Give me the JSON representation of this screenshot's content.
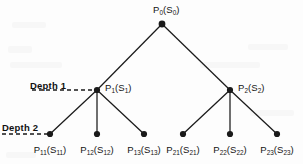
{
  "figure": {
    "type": "tree-diagram",
    "background_color": "#fdfdfd",
    "stroke_color": "#1a1a1a",
    "width": 303,
    "height": 164
  },
  "depth_markers": [
    {
      "id": "depth-1",
      "label": "Depth 1",
      "text_x": 30,
      "text_y": 80,
      "line_x1": 32,
      "line_x2": 95,
      "line_y": 90
    },
    {
      "id": "depth-2",
      "label": "Depth 2",
      "text_x": 2,
      "text_y": 122,
      "line_x1": 2,
      "line_x2": 48,
      "line_y": 134
    }
  ],
  "nodes": [
    {
      "id": "root",
      "name": "P",
      "sub": "0",
      "state_name": "S",
      "state_sub": "0",
      "x": 162,
      "y": 24,
      "label_x": 153,
      "label_y": 4,
      "label_align": "above",
      "level": 0
    },
    {
      "id": "n1",
      "name": "P",
      "sub": "1",
      "state_name": "S",
      "state_sub": "1",
      "x": 97,
      "y": 90,
      "label_x": 105,
      "label_y": 82,
      "label_align": "right",
      "level": 1
    },
    {
      "id": "n2",
      "name": "P",
      "sub": "2",
      "state_name": "S",
      "state_sub": "2",
      "x": 230,
      "y": 90,
      "label_x": 238,
      "label_y": 82,
      "label_align": "right",
      "level": 1
    },
    {
      "id": "n11",
      "name": "P",
      "sub": "11",
      "state_name": "S",
      "state_sub": "11",
      "x": 50,
      "y": 134,
      "label_x": 50,
      "label_y": 144,
      "label_align": "below",
      "level": 2
    },
    {
      "id": "n12",
      "name": "P",
      "sub": "12",
      "state_name": "S",
      "state_sub": "12",
      "x": 97,
      "y": 134,
      "label_x": 97,
      "label_y": 144,
      "label_align": "below",
      "level": 2
    },
    {
      "id": "n13",
      "name": "P",
      "sub": "13",
      "state_name": "S",
      "state_sub": "13",
      "x": 144,
      "y": 134,
      "label_x": 144,
      "label_y": 144,
      "label_align": "below",
      "level": 2
    },
    {
      "id": "n21",
      "name": "P",
      "sub": "21",
      "state_name": "S",
      "state_sub": "21",
      "x": 183,
      "y": 134,
      "label_x": 183,
      "label_y": 144,
      "label_align": "below",
      "level": 2
    },
    {
      "id": "n22",
      "name": "P",
      "sub": "22",
      "state_name": "S",
      "state_sub": "22",
      "x": 230,
      "y": 134,
      "label_x": 230,
      "label_y": 144,
      "label_align": "below",
      "level": 2
    },
    {
      "id": "n23",
      "name": "P",
      "sub": "23",
      "state_name": "S",
      "state_sub": "23",
      "x": 277,
      "y": 134,
      "label_x": 277,
      "label_y": 144,
      "label_align": "below",
      "level": 2
    }
  ],
  "edges": [
    {
      "from": "root",
      "to": "n1"
    },
    {
      "from": "root",
      "to": "n2"
    },
    {
      "from": "n1",
      "to": "n11"
    },
    {
      "from": "n1",
      "to": "n12"
    },
    {
      "from": "n1",
      "to": "n13"
    },
    {
      "from": "n2",
      "to": "n21"
    },
    {
      "from": "n2",
      "to": "n22"
    },
    {
      "from": "n2",
      "to": "n23"
    }
  ],
  "labels": {
    "root": "P0(S0)",
    "n1": "P1(S1)",
    "n2": "P2(S2)",
    "n11": "P11(S11)",
    "n12": "P12(S12)",
    "n13": "P13(S13)",
    "n21": "P21(S21)",
    "n22": "P22(S22)",
    "n23": "P23(S23)"
  }
}
